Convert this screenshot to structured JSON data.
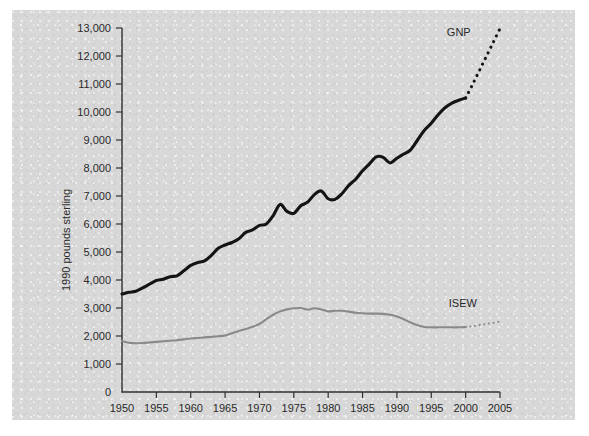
{
  "chart_data": {
    "type": "line",
    "title": "",
    "xlabel": "",
    "ylabel": "1990 pounds sterling",
    "xlim": [
      1950,
      2005
    ],
    "ylim": [
      0,
      13000
    ],
    "grid": false,
    "legend_position": "inline-right",
    "y_ticks": [
      0,
      1000,
      2000,
      3000,
      4000,
      5000,
      6000,
      7000,
      8000,
      9000,
      10000,
      11000,
      12000,
      13000
    ],
    "y_tick_labels": [
      "0",
      "1,000",
      "2,000",
      "3,000",
      "4,000",
      "5,000",
      "6,000",
      "7,000",
      "8,000",
      "9,000",
      "10,000",
      "11,000",
      "12,000",
      "13,000"
    ],
    "x_ticks": [
      1950,
      1955,
      1960,
      1965,
      1970,
      1975,
      1980,
      1985,
      1990,
      1995,
      2000,
      2005
    ],
    "x_tick_labels": [
      "1950",
      "1955",
      "1960",
      "1965",
      "1970",
      "1975",
      "1980",
      "1985",
      "1990",
      "1995",
      "2000",
      "2005"
    ],
    "series": [
      {
        "name": "GNP",
        "color": "#141414",
        "style": "solid",
        "label_x": 1999.0,
        "label_y": 12700,
        "x": [
          1950,
          1951,
          1952,
          1953,
          1954,
          1955,
          1956,
          1957,
          1958,
          1959,
          1960,
          1961,
          1962,
          1963,
          1964,
          1965,
          1966,
          1967,
          1968,
          1969,
          1970,
          1971,
          1972,
          1973,
          1974,
          1975,
          1976,
          1977,
          1978,
          1979,
          1980,
          1981,
          1982,
          1983,
          1984,
          1985,
          1986,
          1987,
          1988,
          1989,
          1990,
          1991,
          1992,
          1993,
          1994,
          1995,
          1996,
          1997,
          1998,
          1999,
          2000
        ],
        "values": [
          3500,
          3560,
          3600,
          3720,
          3850,
          3980,
          4030,
          4120,
          4150,
          4330,
          4520,
          4620,
          4680,
          4880,
          5130,
          5250,
          5340,
          5470,
          5700,
          5790,
          5950,
          6000,
          6300,
          6700,
          6450,
          6380,
          6650,
          6780,
          7050,
          7180,
          6900,
          6880,
          7080,
          7380,
          7600,
          7900,
          8150,
          8400,
          8380,
          8180,
          8350,
          8500,
          8650,
          9000,
          9350,
          9600,
          9900,
          10150,
          10320,
          10420,
          10500
        ]
      },
      {
        "name": "GNP projection",
        "color": "#141414",
        "style": "dotted",
        "x": [
          2000,
          2001,
          2002,
          2003,
          2004,
          2005
        ],
        "values": [
          10500,
          10980,
          11480,
          11980,
          12480,
          12980
        ]
      },
      {
        "name": "ISEW",
        "color": "#8a8a8a",
        "style": "solid",
        "label_x": 1999.6,
        "label_y": 3050,
        "x": [
          1950,
          1951,
          1952,
          1953,
          1954,
          1955,
          1956,
          1957,
          1958,
          1959,
          1960,
          1961,
          1962,
          1963,
          1964,
          1965,
          1966,
          1967,
          1968,
          1969,
          1970,
          1971,
          1972,
          1973,
          1974,
          1975,
          1976,
          1977,
          1978,
          1979,
          1980,
          1981,
          1982,
          1983,
          1984,
          1985,
          1986,
          1987,
          1988,
          1989,
          1990,
          1991,
          1992,
          1993,
          1994,
          1995,
          1996,
          1997,
          1998,
          1999,
          2000
        ],
        "values": [
          1820,
          1760,
          1740,
          1750,
          1770,
          1790,
          1810,
          1830,
          1850,
          1880,
          1910,
          1930,
          1950,
          1970,
          1990,
          2020,
          2100,
          2180,
          2250,
          2330,
          2430,
          2600,
          2760,
          2880,
          2950,
          2990,
          3000,
          2940,
          2990,
          2950,
          2880,
          2900,
          2900,
          2870,
          2830,
          2810,
          2800,
          2800,
          2790,
          2760,
          2700,
          2600,
          2480,
          2380,
          2320,
          2310,
          2310,
          2310,
          2310,
          2310,
          2320
        ]
      },
      {
        "name": "ISEW projection",
        "color": "#8a8a8a",
        "style": "dotted",
        "x": [
          2000,
          2001,
          2002,
          2003,
          2004,
          2005
        ],
        "values": [
          2320,
          2350,
          2390,
          2430,
          2470,
          2520
        ]
      }
    ]
  }
}
